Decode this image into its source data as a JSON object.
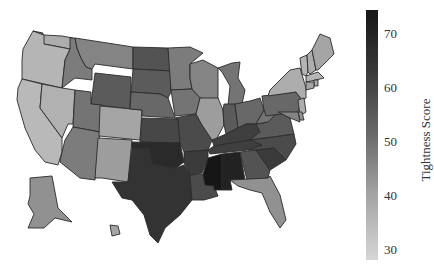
{
  "chart_data": {
    "type": "choropleth",
    "title": "",
    "colorbar": {
      "label": "Tightness Score",
      "ticks": [
        30,
        40,
        50,
        60,
        70
      ],
      "range": [
        27,
        75
      ],
      "colorscale": "Greys"
    },
    "regions": {
      "WA": 38,
      "OR": 36,
      "CA": 35,
      "NV": 37,
      "ID": 50,
      "MT": 48,
      "WY": 58,
      "UT": 52,
      "AZ": 50,
      "CO": 40,
      "NM": 42,
      "ND": 60,
      "SD": 58,
      "NE": 55,
      "KS": 63,
      "OK": 70,
      "TX": 68,
      "MN": 50,
      "IA": 52,
      "MO": 62,
      "AR": 66,
      "LA": 62,
      "WI": 48,
      "IL": 42,
      "MI": 52,
      "IN": 58,
      "OH": 55,
      "KY": 65,
      "TN": 65,
      "MS": 75,
      "AL": 72,
      "GA": 60,
      "FL": 45,
      "SC": 66,
      "NC": 62,
      "VA": 58,
      "WV": 52,
      "PA": 55,
      "NY": 38,
      "VT": 36,
      "NH": 38,
      "ME": 40,
      "MA": 36,
      "RI": 38,
      "CT": 40,
      "NJ": 38,
      "DE": 45,
      "MD": 48,
      "AK": 45,
      "HI": 40
    }
  },
  "colorbar": {
    "title": "Tightness Score",
    "ticks": [
      "70",
      "60",
      "50",
      "40",
      "30"
    ]
  }
}
